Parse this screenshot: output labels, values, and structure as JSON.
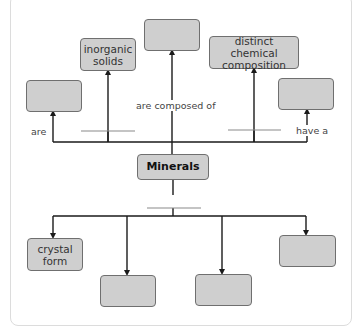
{
  "diagram": {
    "type": "concept-map",
    "central_concept": "Minerals",
    "colors": {
      "node_fill": "#cfcfcf",
      "node_border": "#6f6f6f",
      "line": "#1a1a1a",
      "separator": "#8a8a8a"
    },
    "top_nodes": [
      {
        "id": "top-left-blank",
        "label": ""
      },
      {
        "id": "inorganic-solids",
        "label": "inorganic solids"
      },
      {
        "id": "top-center-blank",
        "label": ""
      },
      {
        "id": "distinct-chemical-composition",
        "label": "distinct chemical composition"
      },
      {
        "id": "top-right-blank",
        "label": ""
      }
    ],
    "bottom_nodes": [
      {
        "id": "crystal-form",
        "label": "crystal form"
      },
      {
        "id": "bottom-blank-1",
        "label": ""
      },
      {
        "id": "bottom-blank-2",
        "label": ""
      },
      {
        "id": "bottom-blank-3",
        "label": ""
      }
    ],
    "link_labels": {
      "are": "are",
      "are_composed_of": "are composed of",
      "have_a": "have a"
    }
  }
}
